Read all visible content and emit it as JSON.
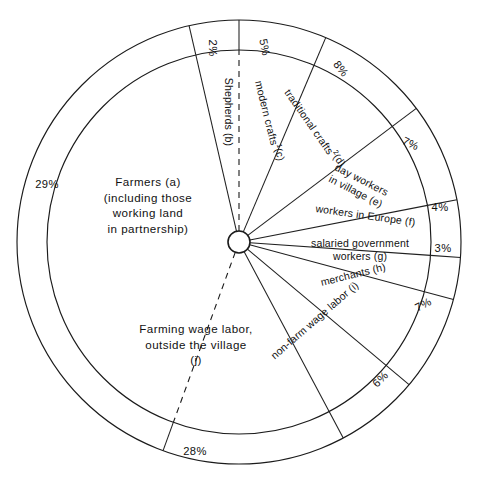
{
  "figure": {
    "type": "pie",
    "center": {
      "x": 239,
      "y": 242
    },
    "hub_radius": 11,
    "inner_radius": 192,
    "outer_radius": 222
  },
  "chart_data": {
    "type": "pie",
    "title": "",
    "subtitle": "",
    "xlabel": "",
    "ylabel": "",
    "legend_position": "none",
    "grid": false,
    "units": "percent",
    "total": 99,
    "note": "Percentage labels are printed in the outer annulus ring; category names are printed inside the sectors.",
    "categories": [
      "Farmers (a) (including those working land in partnership)",
      "Shepherds (b)",
      "modern crafts¹(c)",
      "traditional crafts²(d)",
      "day workers in village (e)",
      "workers in Europe (f)",
      "salaried government workers (g)",
      "merchants (h)",
      "non-farm wage labor (i)",
      "Farming wage labor, outside the village (j)"
    ],
    "values": [
      29,
      2,
      5,
      8,
      7,
      4,
      3,
      7,
      6,
      28
    ],
    "labels": [
      "29%",
      "2%",
      "5%",
      "8%",
      "7%",
      "4%",
      "3%",
      "7%",
      "6%",
      "28%"
    ],
    "keys": [
      "a",
      "b",
      "c",
      "d",
      "e",
      "f",
      "g",
      "h",
      "i",
      "j"
    ]
  },
  "slices": [
    {
      "key": "a",
      "pct_label": "29%",
      "value": 29,
      "start_deg": 200,
      "end_deg": 347,
      "divider_style": "dashed",
      "name_lines": [
        "Farmers     (a)",
        "(including those",
        "working land",
        "in partnership)"
      ],
      "label_x": 148,
      "label_y": 186,
      "label_rotation": 0,
      "label_anchor": "middle",
      "label_class": "big",
      "pct_x": 47,
      "pct_y": 188,
      "pct_rotation": 0
    },
    {
      "key": "b",
      "pct_label": "2%",
      "value": 2,
      "start_deg": 347,
      "end_deg": 360,
      "divider_style": "solid",
      "name_lines": [
        "Shepherds (b)"
      ],
      "label_x": 225,
      "label_y": 112,
      "label_rotation": 90,
      "label_anchor": "middle",
      "label_class": "normal",
      "pct_x": 209,
      "pct_y": 48,
      "pct_rotation": 90
    },
    {
      "key": "c",
      "pct_label": "5%",
      "value": 5,
      "start_deg": 0,
      "end_deg": 23,
      "divider_style": "dashed",
      "name_lines": [
        "modern crafts¹(c)"
      ],
      "label_x": 265,
      "label_y": 122,
      "label_rotation": 76,
      "label_anchor": "middle",
      "label_class": "normal",
      "pct_x": 261,
      "pct_y": 48,
      "pct_rotation": 78
    },
    {
      "key": "d",
      "pct_label": "8%",
      "value": 8,
      "start_deg": 23,
      "end_deg": 53,
      "divider_style": "solid",
      "name_lines": [
        "traditional crafts²(d)"
      ],
      "label_x": 311,
      "label_y": 131,
      "label_rotation": 55,
      "label_anchor": "middle",
      "label_class": "normal",
      "pct_x": 338,
      "pct_y": 71,
      "pct_rotation": 52
    },
    {
      "key": "e",
      "pct_label": "7%",
      "value": 7,
      "start_deg": 53,
      "end_deg": 79,
      "divider_style": "solid",
      "name_lines": [
        "day workers",
        "in village (e)"
      ],
      "label_x": 360,
      "label_y": 183,
      "label_rotation": 27,
      "label_anchor": "middle",
      "label_class": "normal",
      "pct_x": 409,
      "pct_y": 147,
      "pct_rotation": 25
    },
    {
      "key": "f",
      "pct_label": "4%",
      "value": 4,
      "start_deg": 79,
      "end_deg": 94,
      "divider_style": "solid",
      "name_lines": [
        "workers in Europe (f)"
      ],
      "label_x": 365,
      "label_y": 219,
      "label_rotation": 8,
      "label_anchor": "middle",
      "label_class": "normal",
      "pct_x": 440,
      "pct_y": 211,
      "pct_rotation": 0
    },
    {
      "key": "g",
      "pct_label": "3%",
      "value": 3,
      "start_deg": 94,
      "end_deg": 105,
      "divider_style": "solid",
      "name_lines": [
        "salaried government",
        "workers (g)"
      ],
      "label_x": 360,
      "label_y": 247,
      "label_rotation": 0,
      "label_anchor": "middle",
      "label_class": "normal",
      "pct_x": 443,
      "pct_y": 252,
      "pct_rotation": 0
    },
    {
      "key": "h",
      "pct_label": "7%",
      "value": 7,
      "start_deg": 105,
      "end_deg": 130,
      "divider_style": "solid",
      "name_lines": [
        "merchants  (h)"
      ],
      "label_x": 354,
      "label_y": 278,
      "label_rotation": -14,
      "label_anchor": "middle",
      "label_class": "normal",
      "pct_x": 425,
      "pct_y": 308,
      "pct_rotation": -27
    },
    {
      "key": "i",
      "pct_label": "6%",
      "value": 6,
      "start_deg": 130,
      "end_deg": 152,
      "divider_style": "solid",
      "name_lines": [
        "non-farm wage labor (i)"
      ],
      "label_x": 317,
      "label_y": 323,
      "label_rotation": -41,
      "label_anchor": "middle",
      "label_class": "normal",
      "pct_x": 383,
      "pct_y": 382,
      "pct_rotation": -45
    },
    {
      "key": "j",
      "pct_label": "28%",
      "value": 28,
      "start_deg": 152,
      "end_deg": 200,
      "divider_style": "solid",
      "name_lines": [
        "Farming wage labor,",
        "outside the village",
        "",
        "(j)"
      ],
      "label_x": 196,
      "label_y": 333,
      "label_rotation": 0,
      "label_anchor": "middle",
      "label_class": "big",
      "pct_x": 195,
      "pct_y": 455,
      "pct_rotation": 0
    }
  ]
}
